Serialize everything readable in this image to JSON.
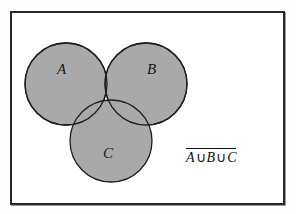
{
  "figure": {
    "type": "venn-diagram",
    "frame": {
      "border_color": "#2a2a2a",
      "background_color": "#ffffff"
    },
    "sets": [
      {
        "id": "A",
        "label": "A",
        "cx": 66,
        "cy": 84,
        "r": 41
      },
      {
        "id": "B",
        "label": "B",
        "cx": 146,
        "cy": 84,
        "r": 41
      },
      {
        "id": "C",
        "label": "C",
        "cx": 111,
        "cy": 141,
        "r": 41
      }
    ],
    "shading": {
      "description": "All three circles shaded",
      "fill_color": "#a9a9a9",
      "stroke_color": "#1f1f1f"
    },
    "formula": {
      "overline": true,
      "term_a": "A",
      "union_1": "∪",
      "term_b": "B",
      "union_2": "∪",
      "term_c": "C",
      "plain_text": "A ∪ B ∪ C"
    }
  }
}
